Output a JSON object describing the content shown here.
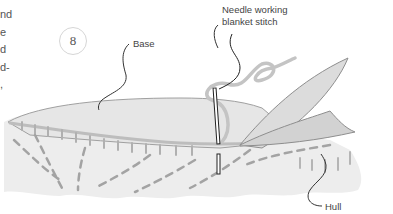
{
  "page": {
    "body_text_fragments": [
      "nd",
      "e",
      "d",
      "d-",
      ","
    ],
    "step_number": "8"
  },
  "figure": {
    "labels": {
      "base": "Base",
      "needle_line1": "Needle working",
      "needle_line2": "blanket stitch",
      "hull": "Hull"
    },
    "colors": {
      "fill": "#ececec",
      "fill_dark": "#d9d9d9",
      "stroke": "#9a9a9a",
      "stitch": "#a8a8a8",
      "leader": "#333333"
    }
  }
}
